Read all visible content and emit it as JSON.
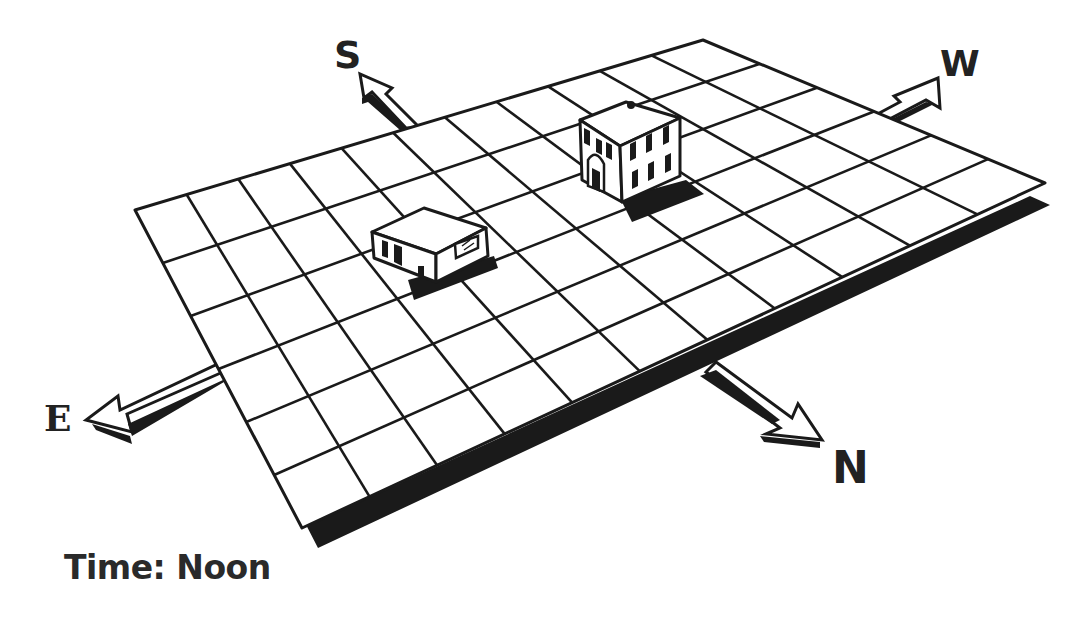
{
  "diagram": {
    "type": "isometric-map",
    "grid": {
      "columns": 11,
      "rows": 6,
      "corners": {
        "top_left": [
          135,
          210
        ],
        "top_right": [
          703,
          40
        ],
        "bottom_right": [
          1045,
          183
        ],
        "bottom_left": [
          302,
          528
        ]
      },
      "line_color": "#1a1a1a",
      "fill_color": "#ffffff",
      "shadow_color": "#1a1a1a"
    },
    "compass": {
      "south": {
        "label": "S",
        "direction": "up-left"
      },
      "west": {
        "label": "W",
        "direction": "up-right"
      },
      "east": {
        "label": "E",
        "direction": "down-left"
      },
      "north": {
        "label": "N",
        "direction": "down-right"
      }
    },
    "buildings": [
      {
        "name": "small-building",
        "type": "one-story",
        "shadow": "north"
      },
      {
        "name": "tall-building",
        "type": "two-story-with-arched-door",
        "shadow": "north"
      }
    ],
    "caption": {
      "prefix": "Time:",
      "value": "Noon",
      "full": "Time: Noon"
    }
  }
}
